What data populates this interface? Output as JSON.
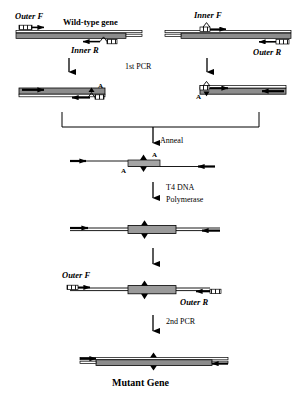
{
  "figure": {
    "colors": {
      "gene_fill": "#8c8c8c",
      "gene_stroke": "#000000",
      "primer_fill": "#ffffff",
      "line": "#000000",
      "background": "#ffffff",
      "mutation_box": "#9a9a9a"
    },
    "steps": [
      {
        "id": "step-1st-pcr",
        "label": "1st PCR"
      },
      {
        "id": "step-anneal",
        "label": "Anneal"
      },
      {
        "id": "step-t4-line1",
        "label": "T4 DNA"
      },
      {
        "id": "step-t4-line2",
        "label": "Polymerase"
      },
      {
        "id": "step-2nd-pcr",
        "label": "2nd PCR"
      }
    ],
    "primers": {
      "outer_f": "Outer F",
      "outer_r": "Outer R",
      "inner_f": "Inner F",
      "inner_r": "Inner R"
    },
    "templates": {
      "wild_type": "Wild-type gene",
      "mutant": "Mutant Gene"
    },
    "mutation_marker": "A",
    "rows": [
      {
        "name": "row-template-left",
        "description": "Wild-type gene template with Outer F and Inner R primers",
        "labels": [
          "Outer F",
          "Wild-type gene",
          "Inner R"
        ]
      },
      {
        "name": "row-template-right",
        "description": "Wild-type gene template with Inner F and Outer R primers",
        "labels": [
          "Inner F",
          "Outer R"
        ]
      },
      {
        "name": "row-pcr-products",
        "description": "Two first-round PCR products each carrying the A mutation",
        "labels": [
          "A",
          "A"
        ]
      },
      {
        "name": "row-annealed",
        "description": "Annealed heteroduplex with overlapping mutated ends",
        "labels": [
          "A",
          "A"
        ]
      },
      {
        "name": "row-filled",
        "description": "Full-length duplex after T4 DNA Polymerase fill-in",
        "labels": []
      },
      {
        "name": "row-outer-primers",
        "description": "Full-length duplex annealed with Outer F and Outer R primers",
        "labels": [
          "Outer F",
          "Outer R"
        ]
      },
      {
        "name": "row-mutant-gene",
        "description": "Final amplified mutant gene product",
        "labels": [
          "Mutant Gene"
        ]
      }
    ]
  }
}
